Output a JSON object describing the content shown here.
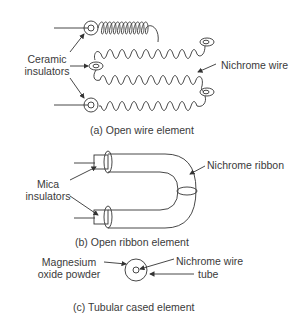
{
  "diagram": {
    "panels": [
      {
        "id": "a",
        "caption": "(a) Open wire element",
        "labels": {
          "insulators_line1": "Ceramic",
          "insulators_line2": "insulators",
          "wire": "Nichrome wire"
        }
      },
      {
        "id": "b",
        "caption": "(b) Open ribbon element",
        "labels": {
          "insulators_line1": "Mica",
          "insulators_line2": "insulators",
          "ribbon": "Nichrome ribbon"
        }
      },
      {
        "id": "c",
        "caption": "(c) Tubular cased element",
        "labels": {
          "powder_line1": "Magnesium",
          "powder_line2": "oxide powder",
          "wire": "Nichrome wire",
          "tube": "tube"
        }
      }
    ]
  }
}
